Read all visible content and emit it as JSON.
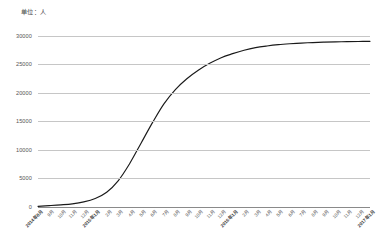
{
  "unit_label": "单位：人",
  "colors": {
    "background": "#ffffff",
    "gridline": "#c6c6c6",
    "axis": "#8a8a8a",
    "series": "#1a1a1a",
    "tick_text": "#555555"
  },
  "chart_data": {
    "type": "line",
    "title": "",
    "subtitle": "",
    "xlabel": "",
    "ylabel": "单位：人",
    "ylim": [
      0,
      30000
    ],
    "yticks": [
      0,
      5000,
      10000,
      15000,
      20000,
      25000,
      30000
    ],
    "ytick_labels": [
      "0",
      "5000",
      "10000",
      "15000",
      "20000",
      "25000",
      "30000"
    ],
    "grid": true,
    "legend": "none",
    "categories": [
      "2014年8月",
      "9月",
      "10月",
      "11月",
      "12月",
      "2015年1月",
      "2月",
      "3月",
      "4月",
      "5月",
      "6月",
      "7月",
      "8月",
      "9月",
      "10月",
      "11月",
      "12月",
      "2016年1月",
      "2月",
      "3月",
      "4月",
      "5月",
      "6月",
      "7月",
      "8月",
      "9月",
      "10月",
      "11月",
      "12月",
      "2017年1月"
    ],
    "series": [
      {
        "name": "累计人数",
        "values": [
          120,
          240,
          380,
          560,
          900,
          1500,
          2600,
          4600,
          7600,
          11200,
          14800,
          18100,
          20600,
          22500,
          24000,
          25200,
          26200,
          26900,
          27500,
          27950,
          28250,
          28480,
          28640,
          28760,
          28850,
          28920,
          28970,
          29010,
          29040,
          29060
        ]
      }
    ]
  }
}
